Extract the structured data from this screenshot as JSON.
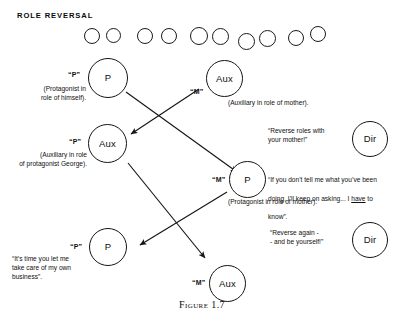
{
  "figure": {
    "heading": "ROLE REVERSAL",
    "caption": "Figure 1.7"
  },
  "top_circle_row": {
    "count": 11,
    "circles": [
      {
        "x": 84,
        "y": 28,
        "d": 14
      },
      {
        "x": 106,
        "y": 28,
        "d": 13
      },
      {
        "x": 137,
        "y": 28,
        "d": 14
      },
      {
        "x": 161,
        "y": 28,
        "d": 14
      },
      {
        "x": 190,
        "y": 27,
        "d": 16
      },
      {
        "x": 212,
        "y": 28,
        "d": 15
      },
      {
        "x": 238,
        "y": 33,
        "d": 15
      },
      {
        "x": 259,
        "y": 30,
        "d": 15
      },
      {
        "x": 288,
        "y": 30,
        "d": 14
      },
      {
        "x": 310,
        "y": 26,
        "d": 14
      }
    ]
  },
  "nodes": [
    {
      "id": "p-top",
      "letter": "P",
      "tag": "“P”",
      "caption": "(Protagonist in\nrole of himself).",
      "caption_align": "right"
    },
    {
      "id": "aux-top-right",
      "letter": "Aux",
      "tag": "“M”",
      "caption": "(Auxiliary in role of mother).",
      "caption_align": "left"
    },
    {
      "id": "dir-upper",
      "letter": "Dir",
      "tag": "",
      "caption": "“Reverse roles with\nyour mother!”",
      "caption_align": "left"
    },
    {
      "id": "aux-left",
      "letter": "Aux",
      "tag": "“P”",
      "caption": "(Auxiliary in role\nof protagonist George).",
      "caption_align": "right"
    },
    {
      "id": "p-middle",
      "letter": "P",
      "tag": "“M”",
      "caption": "",
      "caption_align": "left"
    },
    {
      "id": "dir-lower",
      "letter": "Dir",
      "tag": "",
      "caption": "“Reverse again -\n- and be yourself!”",
      "caption_align": "left"
    },
    {
      "id": "p-bottom",
      "letter": "P",
      "tag": "“P”",
      "caption": "“It’s time you let me\ntake care of my own\nbusiness”.",
      "caption_align": "left"
    },
    {
      "id": "aux-bottom",
      "letter": "Aux",
      "tag": "“M”",
      "caption": "",
      "caption_align": "left"
    }
  ],
  "quotes": {
    "protagonist_as_mother_line1": "“If you don’t tell me what you’ve been",
    "protagonist_as_mother_line2_a": "doing, I’ll keep on asking... I ",
    "protagonist_as_mother_line2_em": "have",
    "protagonist_as_mother_line2_b": " to",
    "protagonist_as_mother_line3": "know”.",
    "protagonist_as_mother_role": "(Protagonist in role of mother)."
  },
  "colors": {
    "ink": "#101010",
    "background": "#ffffff"
  }
}
